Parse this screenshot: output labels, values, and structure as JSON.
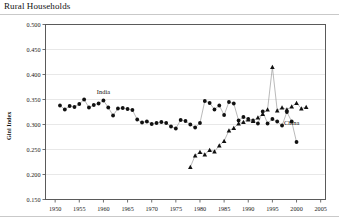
{
  "figure": {
    "title": "Rural Households"
  },
  "chart_data": {
    "type": "line",
    "title": "Rural Households",
    "xlabel": "",
    "ylabel": "Gini Index",
    "xlim": [
      1948,
      2006
    ],
    "ylim": [
      0.15,
      0.5
    ],
    "grid": true,
    "legend_position": "inline-annotations",
    "yticks": [
      "0.150",
      "0.200",
      "0.250",
      "0.300",
      "0.350",
      "0.400",
      "0.450",
      "0.500"
    ],
    "ytick_values": [
      0.15,
      0.2,
      0.25,
      0.3,
      0.35,
      0.4,
      0.45,
      0.5
    ],
    "xticks": [
      "1950",
      "1955",
      "1960",
      "1965",
      "1970",
      "1975",
      "1980",
      "1985",
      "1990",
      "1995",
      "2000",
      "2005"
    ],
    "xtick_values": [
      1950,
      1955,
      1960,
      1965,
      1970,
      1975,
      1980,
      1985,
      1990,
      1995,
      2000,
      2005
    ],
    "annotations": [
      {
        "text": "India",
        "x": 1960,
        "y": 0.362
      },
      {
        "text": "China",
        "x": 1999,
        "y": 0.3
      }
    ],
    "series": [
      {
        "name": "India",
        "marker": "circle",
        "color": "#111111",
        "x": [
          1951,
          1952,
          1953,
          1954,
          1955,
          1956,
          1957,
          1958,
          1959,
          1960,
          1961,
          1962,
          1963,
          1964,
          1965,
          1966,
          1967,
          1968,
          1969,
          1970,
          1971,
          1972,
          1973,
          1974,
          1975,
          1976,
          1977,
          1978,
          1979,
          1980,
          1981,
          1982,
          1983,
          1984,
          1985,
          1986,
          1987,
          1988,
          1989,
          1990,
          1991,
          1992,
          1993,
          1994,
          1995,
          1996,
          1997,
          1998,
          1999,
          2000
        ],
        "values": [
          0.338,
          0.33,
          0.337,
          0.335,
          0.341,
          0.35,
          0.334,
          0.339,
          0.342,
          0.348,
          0.334,
          0.318,
          0.332,
          0.333,
          0.331,
          0.329,
          0.31,
          0.304,
          0.306,
          0.301,
          0.303,
          0.305,
          0.303,
          0.296,
          0.292,
          0.309,
          0.307,
          0.3,
          0.294,
          0.303,
          0.347,
          0.343,
          0.33,
          0.338,
          0.319,
          0.345,
          0.342,
          0.308,
          0.315,
          0.311,
          0.308,
          0.302,
          0.326,
          0.302,
          0.311,
          0.306,
          0.298,
          0.325,
          0.306,
          0.265
        ]
      },
      {
        "name": "China",
        "marker": "triangle",
        "color": "#111111",
        "x": [
          1978,
          1979,
          1980,
          1981,
          1982,
          1983,
          1984,
          1985,
          1986,
          1987,
          1988,
          1989,
          1990,
          1991,
          1992,
          1993,
          1994,
          1995,
          1996,
          1997,
          1998,
          1999,
          2000,
          2001,
          2002
        ],
        "values": [
          0.215,
          0.238,
          0.245,
          0.24,
          0.249,
          0.246,
          0.258,
          0.267,
          0.288,
          0.293,
          0.302,
          0.305,
          0.31,
          0.307,
          0.314,
          0.321,
          0.33,
          0.415,
          0.328,
          0.334,
          0.33,
          0.336,
          0.343,
          0.332,
          0.335
        ]
      }
    ]
  }
}
